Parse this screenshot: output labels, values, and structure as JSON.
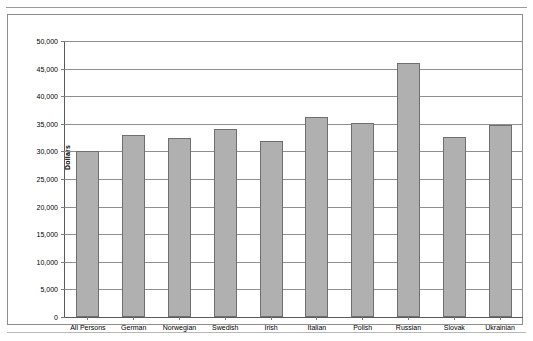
{
  "chart_data": {
    "type": "bar",
    "title": "",
    "xlabel": "",
    "ylabel": "Dollars",
    "ylim": [
      0,
      50000
    ],
    "ytick_labels": [
      "50,000",
      "45,000",
      "40,000",
      "35,000",
      "30,000",
      "25,000",
      "20,000",
      "15,000",
      "10,000",
      "5,000",
      "0"
    ],
    "ytick_values": [
      50000,
      45000,
      40000,
      35000,
      30000,
      25000,
      20000,
      15000,
      10000,
      5000,
      0
    ],
    "grid": true,
    "legend": "none",
    "bar_color": "#b0b0b0",
    "bar_border_color": "#6f6f6f",
    "categories": [
      "All Persons",
      "German",
      "Norwegian",
      "Swedish",
      "Irish",
      "Italian",
      "Polish",
      "Russian",
      "Slovak",
      "Ukrainian"
    ],
    "values": [
      30100,
      32900,
      32400,
      34000,
      31900,
      36300,
      35100,
      46000,
      32700,
      34800
    ]
  }
}
